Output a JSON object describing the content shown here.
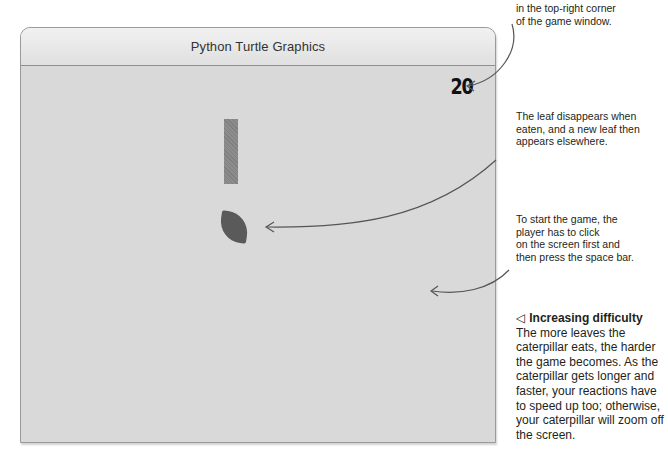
{
  "window": {
    "title": "Python Turtle Graphics"
  },
  "game": {
    "score": "20",
    "caterpillar": {
      "color": "#888888",
      "shape": "vertical-bar"
    },
    "leaf": {
      "color": "#5a5a5a",
      "shape": "leaf"
    },
    "background_color": "#d9d9d9"
  },
  "annotations": [
    {
      "id": "score",
      "lines": [
        "in the top-right corner",
        "of the game window."
      ]
    },
    {
      "id": "leaf",
      "lines": [
        "The leaf disappears when",
        "eaten, and a new leaf then",
        "appears elsewhere."
      ]
    },
    {
      "id": "start",
      "lines": [
        "To start the game, the",
        "player has to click",
        "on the screen first and",
        "then press the space bar."
      ]
    }
  ],
  "caption": {
    "icon": "left-triangle-icon",
    "icon_glyph": "◁",
    "title": "Increasing difficulty",
    "body": "The more leaves the caterpillar eats, the harder the game becomes. As the caterpillar gets longer and faster, your reactions have to speed up too; otherwise, your caterpillar will zoom off the screen."
  }
}
